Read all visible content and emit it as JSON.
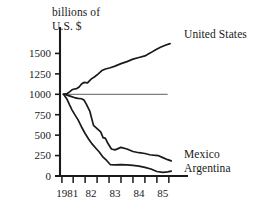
{
  "chart_data": {
    "type": "line",
    "title_line1": "billions of",
    "title_line2": "U.S. $",
    "xlabel": "",
    "ylabel": "billions of U.S. $",
    "xlim": [
      1980.7,
      1985.8
    ],
    "ylim": [
      0,
      1750
    ],
    "yticks": [
      0,
      250,
      500,
      750,
      1000,
      1250,
      1500
    ],
    "ytick_labels": [
      "0",
      "250",
      "500",
      "750",
      "1000",
      "1250",
      "1500"
    ],
    "xticks": [
      1981,
      1982,
      1983,
      1984,
      1985
    ],
    "xtick_labels": [
      "1981",
      "82",
      "83",
      "84",
      "85"
    ],
    "grid": false,
    "legend_position": "right-inline",
    "reference_line": {
      "label": "baseline-1000",
      "y": 1000,
      "x_start": 1980.8,
      "x_end": 1985.2,
      "color": "#808080"
    },
    "line_color": "#1a1a1a",
    "series": [
      {
        "name": "United States",
        "label": "United States",
        "x": [
          1980.85,
          1981.0,
          1981.1,
          1981.2,
          1981.3,
          1981.4,
          1981.5,
          1981.6,
          1981.7,
          1981.85,
          1982.0,
          1982.15,
          1982.3,
          1982.45,
          1982.6,
          1982.8,
          1983.0,
          1983.25,
          1983.5,
          1983.75,
          1984.0,
          1984.25,
          1984.5,
          1984.7,
          1984.9,
          1985.1,
          1985.3
        ],
        "values": [
          1000,
          1010,
          1030,
          1055,
          1065,
          1070,
          1090,
          1125,
          1145,
          1140,
          1185,
          1215,
          1250,
          1290,
          1310,
          1325,
          1345,
          1375,
          1400,
          1430,
          1450,
          1470,
          1510,
          1545,
          1575,
          1600,
          1620
        ]
      },
      {
        "name": "Mexico",
        "label": "Mexico",
        "x": [
          1980.85,
          1981.0,
          1981.15,
          1981.3,
          1981.45,
          1981.6,
          1981.7,
          1981.8,
          1981.95,
          1982.1,
          1982.25,
          1982.4,
          1982.5,
          1982.6,
          1982.7,
          1982.85,
          1983.0,
          1983.25,
          1983.5,
          1983.75,
          1984.0,
          1984.25,
          1984.45,
          1984.6,
          1984.8,
          1985.0,
          1985.2,
          1985.35
        ],
        "values": [
          1000,
          990,
          975,
          960,
          950,
          945,
          930,
          880,
          790,
          620,
          580,
          540,
          470,
          460,
          400,
          330,
          320,
          350,
          330,
          300,
          285,
          275,
          260,
          255,
          250,
          225,
          200,
          185
        ]
      },
      {
        "name": "Argentina",
        "label": "Argentina",
        "x": [
          1980.85,
          1981.0,
          1981.1,
          1981.2,
          1981.3,
          1981.45,
          1981.6,
          1981.75,
          1981.9,
          1982.05,
          1982.2,
          1982.35,
          1982.5,
          1982.65,
          1982.8,
          1983.0,
          1983.25,
          1983.5,
          1983.75,
          1984.0,
          1984.25,
          1984.5,
          1984.75,
          1985.0,
          1985.2,
          1985.35
        ],
        "values": [
          1000,
          935,
          870,
          810,
          760,
          690,
          600,
          520,
          450,
          390,
          340,
          290,
          230,
          190,
          140,
          135,
          140,
          135,
          130,
          120,
          105,
          85,
          55,
          45,
          50,
          60
        ]
      }
    ]
  }
}
